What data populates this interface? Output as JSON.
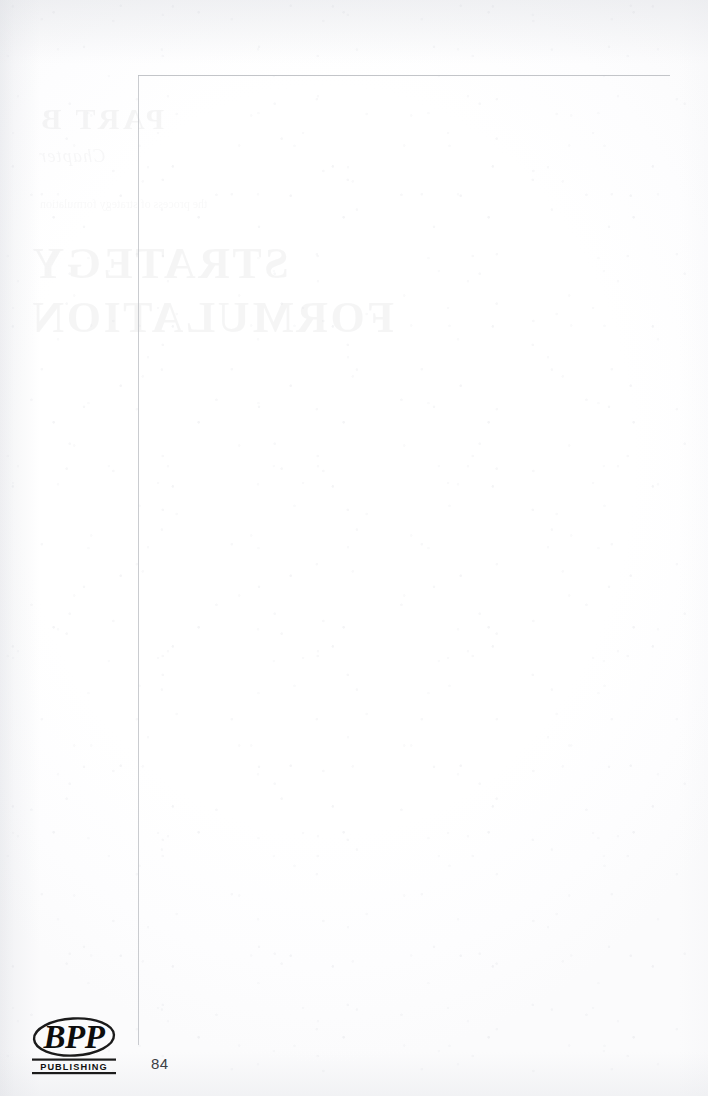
{
  "page": {
    "folio": "84",
    "width": 708,
    "height": 1096,
    "kind": "blank-verso-scan",
    "paper_color": "#ffffff",
    "rule_color": "#b9bbc0"
  },
  "margin_rules": {
    "top_rule_name": "top-margin-rule",
    "left_rule_name": "left-margin-rule"
  },
  "show_through": {
    "note": "Faint mirrored bleed-through of the part-divider printed on the reverse of this leaf",
    "mirrored": true,
    "ink_color": "#2d3138",
    "part_label": "PART B",
    "subtitle": "Chapter",
    "title_line_1": "STRATEGY",
    "title_line_2": "FORMULATION",
    "body_text": "the process of strategy formulation"
  },
  "logo": {
    "wordmark": "BPP",
    "tagline": "PUBLISHING",
    "ink_color": "#1b1b1b"
  }
}
